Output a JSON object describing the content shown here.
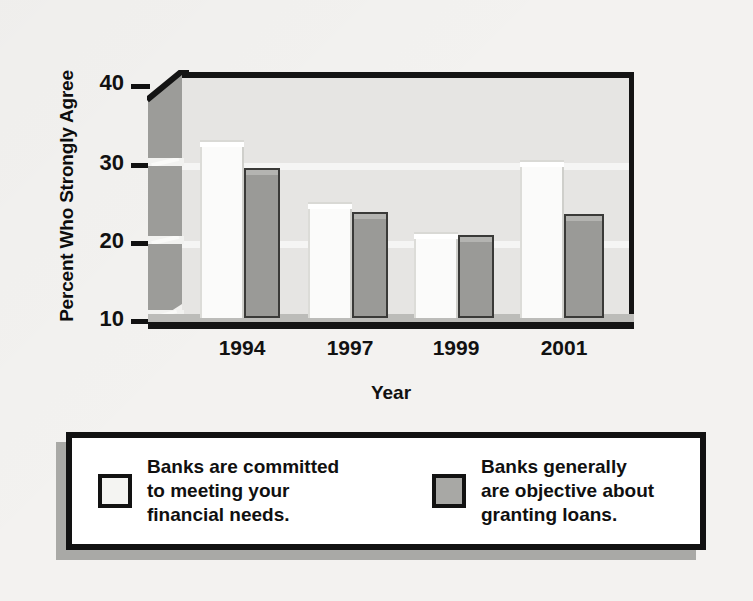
{
  "chart_data": {
    "type": "bar",
    "title": "",
    "xlabel": "Year",
    "ylabel": "Percent Who Strongly Agree",
    "categories": [
      "1994",
      "1997",
      "1999",
      "2001"
    ],
    "ylim": [
      10,
      40
    ],
    "yticks": [
      10,
      20,
      30,
      40
    ],
    "grid": true,
    "legend_position": "bottom",
    "series": [
      {
        "name": "Banks are committed to meeting your financial needs.",
        "short_name": "committed-to-needs",
        "color": "#fbfbfa",
        "values": [
          32.3,
          24.5,
          20.8,
          29.7
        ]
      },
      {
        "name": "Banks generally are objective about granting loans.",
        "short_name": "objective-granting-loans",
        "color": "#9a9a97",
        "values": [
          28.7,
          23.3,
          20.4,
          23.0
        ]
      }
    ]
  },
  "axis": {
    "y_title": "Percent Who Strongly Agree",
    "x_title": "Year",
    "y_tick_labels": [
      "40",
      "30",
      "20",
      "10"
    ],
    "x_tick_labels": [
      "1994",
      "1997",
      "1999",
      "2001"
    ]
  },
  "legend": {
    "items": [
      {
        "swatch": "light-swatch",
        "label": "Banks are committed\nto meeting your\nfinancial needs."
      },
      {
        "swatch": "dark-swatch",
        "label": "Banks generally\nare objective about\ngranting loans."
      }
    ]
  },
  "colors": {
    "background": "#f3f2f0",
    "plot_back_wall": "#e6e5e3",
    "plot_side_wall": "#9c9c99",
    "axis_line": "#141414",
    "series_light": "#fbfbfa",
    "series_dark": "#9a9a97",
    "legend_shadow": "#a9a9a6"
  }
}
